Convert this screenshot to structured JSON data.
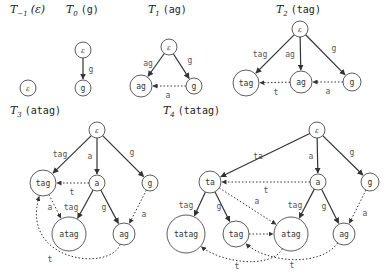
{
  "figure": {
    "panels": [
      {
        "id": "T-1",
        "title": {
          "T": "T",
          "sub": "−1",
          "str": "(ε)",
          "str_is_eps": true,
          "x": 10,
          "y": 13
        },
        "nodes": [
          {
            "id": "eps",
            "label": "ε",
            "x": 28,
            "y": 88,
            "r": 8,
            "eps": true
          }
        ],
        "edges": []
      },
      {
        "id": "T0",
        "title": {
          "T": "T",
          "sub": "0",
          "str": "(g)",
          "x": 66,
          "y": 13
        },
        "nodes": [
          {
            "id": "eps",
            "label": "ε",
            "x": 83,
            "y": 50,
            "r": 8,
            "eps": true
          },
          {
            "id": "g",
            "label": "g",
            "x": 83,
            "y": 88,
            "r": 8
          }
        ],
        "edges": [
          {
            "from": "eps",
            "to": "g",
            "type": "solid",
            "label": "g",
            "lx": 91,
            "ly": 69
          }
        ]
      },
      {
        "id": "T1",
        "title": {
          "T": "T",
          "sub": "1",
          "str": "(ag)",
          "x": 148,
          "y": 13
        },
        "nodes": [
          {
            "id": "eps",
            "label": "ε",
            "x": 169,
            "y": 47,
            "r": 8,
            "eps": true
          },
          {
            "id": "ag",
            "label": "ag",
            "x": 141,
            "y": 86,
            "r": 11
          },
          {
            "id": "g",
            "label": "g",
            "x": 194,
            "y": 86,
            "r": 8
          }
        ],
        "edges": [
          {
            "from": "eps",
            "to": "ag",
            "type": "solid",
            "label": "ag",
            "lx": 148,
            "ly": 63
          },
          {
            "from": "eps",
            "to": "g",
            "type": "solid",
            "label": "g",
            "lx": 190,
            "ly": 60
          },
          {
            "from": "g",
            "to": "ag",
            "type": "dotted",
            "label": "a",
            "lx": 168,
            "ly": 95
          }
        ]
      },
      {
        "id": "T2",
        "title": {
          "T": "T",
          "sub": "2",
          "str": "(tag)",
          "x": 276,
          "y": 13
        },
        "nodes": [
          {
            "id": "eps",
            "label": "ε",
            "x": 300,
            "y": 29,
            "r": 8,
            "eps": true
          },
          {
            "id": "tag",
            "label": "tag",
            "x": 246,
            "y": 83,
            "r": 13
          },
          {
            "id": "ag",
            "label": "ag",
            "x": 301,
            "y": 82,
            "r": 11
          },
          {
            "id": "g",
            "label": "g",
            "x": 352,
            "y": 82,
            "r": 9
          }
        ],
        "edges": [
          {
            "from": "eps",
            "to": "tag",
            "type": "solid",
            "label": "tag",
            "lx": 260,
            "ly": 54
          },
          {
            "from": "eps",
            "to": "ag",
            "type": "solid",
            "label": "ag",
            "lx": 290,
            "ly": 54
          },
          {
            "from": "eps",
            "to": "g",
            "type": "solid",
            "label": "g",
            "lx": 334,
            "ly": 48
          },
          {
            "from": "ag",
            "to": "tag",
            "type": "dotted",
            "label": "t",
            "lx": 276,
            "ly": 92
          },
          {
            "from": "g",
            "to": "ag",
            "type": "dotted",
            "label": "a",
            "lx": 328,
            "ly": 91
          }
        ]
      },
      {
        "id": "T3",
        "title": {
          "T": "T",
          "sub": "3",
          "str": "(atag)",
          "x": 10,
          "y": 114
        },
        "nodes": [
          {
            "id": "eps",
            "label": "ε",
            "x": 97,
            "y": 130,
            "r": 8,
            "eps": true
          },
          {
            "id": "tag",
            "label": "tag",
            "x": 43,
            "y": 183,
            "r": 13
          },
          {
            "id": "a",
            "label": "a",
            "x": 97,
            "y": 183,
            "r": 8
          },
          {
            "id": "g",
            "label": "g",
            "x": 150,
            "y": 183,
            "r": 8
          },
          {
            "id": "atag",
            "label": "atag",
            "x": 69,
            "y": 234,
            "r": 17
          },
          {
            "id": "ag",
            "label": "ag",
            "x": 124,
            "y": 234,
            "r": 11
          }
        ],
        "edges": [
          {
            "from": "eps",
            "to": "tag",
            "type": "solid",
            "label": "tag",
            "lx": 60,
            "ly": 154
          },
          {
            "from": "eps",
            "to": "a",
            "type": "solid",
            "label": "a",
            "lx": 90,
            "ly": 156
          },
          {
            "from": "eps",
            "to": "g",
            "type": "solid",
            "label": "g",
            "lx": 132,
            "ly": 152
          },
          {
            "from": "a",
            "to": "tag",
            "type": "dotted",
            "label": "t",
            "lx": 72,
            "ly": 192
          },
          {
            "from": "a",
            "to": "atag",
            "type": "solid",
            "label": "tag",
            "lx": 71,
            "ly": 207
          },
          {
            "from": "a",
            "to": "ag",
            "type": "solid",
            "label": "g",
            "lx": 104,
            "ly": 207
          },
          {
            "from": "tag",
            "to": "atag",
            "type": "dotted",
            "label": "a",
            "lx": 50,
            "ly": 207
          },
          {
            "from": "g",
            "to": "ag",
            "type": "dotted",
            "label": "a",
            "lx": 144,
            "ly": 214
          },
          {
            "from": "ag",
            "to": "tag",
            "type": "dotted-curve",
            "label": "t",
            "lx": 50,
            "ly": 259,
            "c1x": 110,
            "c1y": 272,
            "c2x": 20,
            "c2y": 262
          }
        ]
      },
      {
        "id": "T4",
        "title": {
          "T": "T",
          "sub": "4",
          "str": "(tatag)",
          "x": 163,
          "y": 114
        },
        "nodes": [
          {
            "id": "eps",
            "label": "ε",
            "x": 317,
            "y": 130,
            "r": 8,
            "eps": true
          },
          {
            "id": "ta",
            "label": "ta",
            "x": 210,
            "y": 182,
            "r": 11
          },
          {
            "id": "a",
            "label": "a",
            "x": 318,
            "y": 182,
            "r": 8
          },
          {
            "id": "g",
            "label": "g",
            "x": 370,
            "y": 182,
            "r": 9
          },
          {
            "id": "tatag",
            "label": "tatag",
            "x": 186,
            "y": 234,
            "r": 19
          },
          {
            "id": "tag",
            "label": "tag",
            "x": 236,
            "y": 234,
            "r": 13
          },
          {
            "id": "atag",
            "label": "atag",
            "x": 291,
            "y": 234,
            "r": 17
          },
          {
            "id": "ag",
            "label": "ag",
            "x": 344,
            "y": 234,
            "r": 11
          }
        ],
        "edges": [
          {
            "from": "eps",
            "to": "ta",
            "type": "solid",
            "label": "ta",
            "lx": 258,
            "ly": 156
          },
          {
            "from": "eps",
            "to": "a",
            "type": "solid",
            "label": "a",
            "lx": 311,
            "ly": 156
          },
          {
            "from": "eps",
            "to": "g",
            "type": "solid",
            "label": "g",
            "lx": 352,
            "ly": 152
          },
          {
            "from": "a",
            "to": "ta",
            "type": "dotted",
            "label": "t",
            "lx": 266,
            "ly": 190
          },
          {
            "from": "ta",
            "to": "tatag",
            "type": "solid",
            "label": "tag",
            "lx": 186,
            "ly": 205
          },
          {
            "from": "ta",
            "to": "tag",
            "type": "solid",
            "label": "g",
            "lx": 219,
            "ly": 206
          },
          {
            "from": "ta",
            "to": "atag",
            "type": "dotted",
            "label": "a",
            "lx": 257,
            "ly": 201
          },
          {
            "from": "a",
            "to": "atag",
            "type": "solid",
            "label": "tag",
            "lx": 295,
            "ly": 205
          },
          {
            "from": "a",
            "to": "ag",
            "type": "solid",
            "label": "g",
            "lx": 324,
            "ly": 206
          },
          {
            "from": "g",
            "to": "ag",
            "type": "dotted",
            "label": "a",
            "lx": 365,
            "ly": 213
          },
          {
            "from": "tag",
            "to": "atag",
            "type": "dotted",
            "label": "",
            "lx": 0,
            "ly": 0
          },
          {
            "from": "atag",
            "to": "tatag",
            "type": "dotted-curve",
            "label": "t",
            "lx": 237,
            "ly": 266,
            "c1x": 270,
            "c1y": 270,
            "c2x": 220,
            "c2y": 262
          },
          {
            "from": "ag",
            "to": "tag",
            "type": "dotted-curve",
            "label": "t",
            "lx": 292,
            "ly": 265,
            "c1x": 320,
            "c1y": 268,
            "c2x": 265,
            "c2y": 262
          }
        ]
      }
    ]
  }
}
